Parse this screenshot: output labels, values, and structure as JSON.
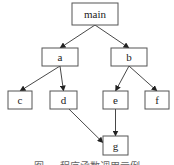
{
  "diagram": {
    "type": "call-graph",
    "nodes": [
      {
        "id": "main",
        "label": "main",
        "x": 72,
        "y": 3,
        "w": 46,
        "h": 22
      },
      {
        "id": "a",
        "label": "a",
        "x": 42,
        "y": 48,
        "w": 36,
        "h": 18
      },
      {
        "id": "b",
        "label": "b",
        "x": 111,
        "y": 48,
        "w": 36,
        "h": 18
      },
      {
        "id": "c",
        "label": "c",
        "x": 8,
        "y": 91,
        "w": 24,
        "h": 18
      },
      {
        "id": "d",
        "label": "d",
        "x": 50,
        "y": 91,
        "w": 27,
        "h": 18
      },
      {
        "id": "e",
        "label": "e",
        "x": 103,
        "y": 91,
        "w": 25,
        "h": 18
      },
      {
        "id": "f",
        "label": "f",
        "x": 145,
        "y": 91,
        "w": 24,
        "h": 18
      },
      {
        "id": "g",
        "label": "g",
        "x": 103,
        "y": 136,
        "w": 25,
        "h": 19
      }
    ],
    "edges": [
      {
        "from": "main",
        "to": "a"
      },
      {
        "from": "main",
        "to": "b"
      },
      {
        "from": "a",
        "to": "c"
      },
      {
        "from": "a",
        "to": "d"
      },
      {
        "from": "b",
        "to": "e"
      },
      {
        "from": "b",
        "to": "f"
      },
      {
        "from": "d",
        "to": "g"
      },
      {
        "from": "e",
        "to": "g"
      }
    ],
    "caption": "图 ... 程序函数调用示例"
  }
}
